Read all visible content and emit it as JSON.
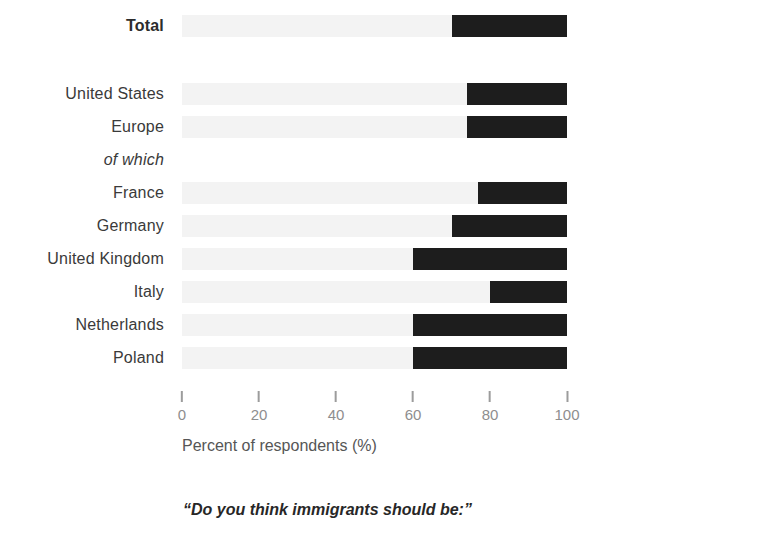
{
  "colors": {
    "background": "#ffffff",
    "bar_dark": "#1d1d1d",
    "bar_light": "#f3f3f3",
    "tick": "#9c9c9c",
    "tick_label": "#8e8e8e",
    "axis_title": "#565656",
    "row_label": "#3a3a3a",
    "caption": "#272727"
  },
  "chart_data": {
    "type": "bar",
    "orientation": "horizontal",
    "stacked": true,
    "title": "",
    "xlabel": "Percent of respondents (%)",
    "ylabel": "",
    "xlim": [
      0,
      100
    ],
    "xticks": [
      0,
      20,
      40,
      60,
      80,
      100
    ],
    "grid": false,
    "legend_position": "none",
    "caption": "“Do you think immigrants should be:”",
    "categories": [
      "Total",
      "United States",
      "Europe",
      "of which",
      "France",
      "Germany",
      "United Kingdom",
      "Italy",
      "Netherlands",
      "Poland"
    ],
    "series": [
      {
        "name": "light-gray-segment",
        "color": "#f3f3f3",
        "values": [
          70,
          74,
          74,
          null,
          77,
          70,
          60,
          80,
          60,
          60
        ]
      },
      {
        "name": "black-segment",
        "color": "#1d1d1d",
        "values": [
          30,
          26,
          26,
          null,
          23,
          30,
          40,
          20,
          40,
          40
        ]
      }
    ],
    "rows": [
      {
        "label": "Total",
        "bold": true,
        "italic": false,
        "no_bar": false,
        "light": 70,
        "dark": 30
      },
      {
        "label": "United States",
        "bold": false,
        "italic": false,
        "no_bar": false,
        "light": 74,
        "dark": 26
      },
      {
        "label": "Europe",
        "bold": false,
        "italic": false,
        "no_bar": false,
        "light": 74,
        "dark": 26
      },
      {
        "label": "of which",
        "bold": false,
        "italic": true,
        "no_bar": true,
        "light": 0,
        "dark": 0
      },
      {
        "label": "France",
        "bold": false,
        "italic": false,
        "no_bar": false,
        "light": 77,
        "dark": 23
      },
      {
        "label": "Germany",
        "bold": false,
        "italic": false,
        "no_bar": false,
        "light": 70,
        "dark": 30
      },
      {
        "label": "United Kingdom",
        "bold": false,
        "italic": false,
        "no_bar": false,
        "light": 60,
        "dark": 40
      },
      {
        "label": "Italy",
        "bold": false,
        "italic": false,
        "no_bar": false,
        "light": 80,
        "dark": 20
      },
      {
        "label": "Netherlands",
        "bold": false,
        "italic": false,
        "no_bar": false,
        "light": 60,
        "dark": 40
      },
      {
        "label": "Poland",
        "bold": false,
        "italic": false,
        "no_bar": false,
        "light": 60,
        "dark": 40
      }
    ]
  }
}
